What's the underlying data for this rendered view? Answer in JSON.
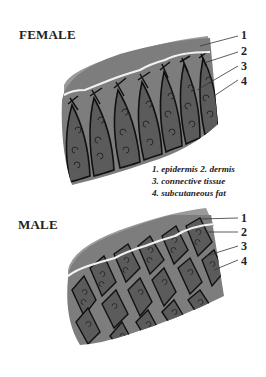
{
  "diagram": {
    "panels": [
      {
        "title": "FEMALE",
        "pattern": "vertical-septa",
        "labels": [
          "1",
          "2",
          "3",
          "4"
        ]
      },
      {
        "title": "MALE",
        "pattern": "criss-cross-septa",
        "labels": [
          "1",
          "2",
          "3",
          "4"
        ]
      }
    ],
    "legend": {
      "line1": "1. epidermis 2. dermis",
      "line2": "3. connective tissue",
      "line3": "4. subcutaneous fat"
    },
    "colors": {
      "epidermis": "#9a9a9a",
      "dermis": "#7d7d7d",
      "fat_lobule": "#5a5a5a",
      "septa": "#111111",
      "boundary": "#f0f0f0"
    }
  }
}
